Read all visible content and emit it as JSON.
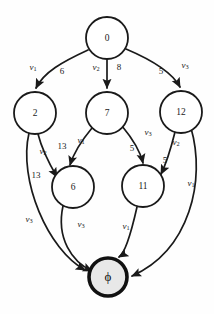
{
  "diagram": {
    "type": "directed-graph",
    "colors": {
      "node_fill": "#ffffff",
      "node_stroke": "#1a1a1a",
      "terminal_fill": "#e8e8e8",
      "terminal_stroke": "#111111",
      "edge_stroke": "#1a1a1a",
      "background": "#fefefe"
    },
    "nodes": [
      {
        "id": "n0",
        "label": "0",
        "cx": 107,
        "cy": 38,
        "r": 21,
        "kind": "normal"
      },
      {
        "id": "n2",
        "label": "2",
        "cx": 35,
        "cy": 113,
        "r": 21,
        "kind": "normal"
      },
      {
        "id": "n7",
        "label": "7",
        "cx": 107,
        "cy": 113,
        "r": 21,
        "kind": "normal"
      },
      {
        "id": "n12",
        "label": "12",
        "cx": 181,
        "cy": 112,
        "r": 21,
        "kind": "normal"
      },
      {
        "id": "n6",
        "label": "6",
        "cx": 73,
        "cy": 187,
        "r": 21,
        "kind": "normal"
      },
      {
        "id": "n11",
        "label": "11",
        "cx": 143,
        "cy": 186,
        "r": 21,
        "kind": "normal"
      },
      {
        "id": "nphi",
        "label": "ϕ",
        "cx": 108,
        "cy": 277,
        "r": 20,
        "kind": "terminal"
      }
    ],
    "edges": [
      {
        "id": "e0-2",
        "from": "n0",
        "to": "n2",
        "weight": "6",
        "variable": "v",
        "variable_sub": "1"
      },
      {
        "id": "e0-7",
        "from": "n0",
        "to": "n7",
        "weight": "8",
        "variable": "v",
        "variable_sub": "2"
      },
      {
        "id": "e0-12",
        "from": "n0",
        "to": "n12",
        "weight": "5",
        "variable": "v",
        "variable_sub": "3"
      },
      {
        "id": "e2-6",
        "from": "n2",
        "to": "n6",
        "weight": "13",
        "variable": "v",
        "variable_sub": "2"
      },
      {
        "id": "e2-phi",
        "from": "n2",
        "to": "nphi",
        "weight": "",
        "variable": "v",
        "variable_sub": "3"
      },
      {
        "id": "e7-6",
        "from": "n7",
        "to": "n6",
        "weight": "13",
        "variable": "v",
        "variable_sub": "1"
      },
      {
        "id": "e7-11",
        "from": "n7",
        "to": "n11",
        "weight": "5",
        "variable": "v",
        "variable_sub": "3"
      },
      {
        "id": "e12-11",
        "from": "n12",
        "to": "n11",
        "weight": "5",
        "variable": "v",
        "variable_sub": "2"
      },
      {
        "id": "e12-phi",
        "from": "n12",
        "to": "nphi",
        "weight": "",
        "variable": "v",
        "variable_sub": "1"
      },
      {
        "id": "e6-phi",
        "from": "n6",
        "to": "nphi",
        "weight": "",
        "variable": "v",
        "variable_sub": "3"
      },
      {
        "id": "e11-phi",
        "from": "n11",
        "to": "nphi",
        "weight": "",
        "variable": "v",
        "variable_sub": "1"
      }
    ],
    "edge_labels": [
      {
        "id": "lbl-v1-a",
        "kind": "variable",
        "text": "v",
        "sub": "1",
        "x": 33,
        "y": 68
      },
      {
        "id": "lbl-6",
        "kind": "weight",
        "text": "6",
        "sub": "",
        "x": 62,
        "y": 72
      },
      {
        "id": "lbl-v2-a",
        "kind": "variable",
        "text": "v",
        "sub": "2",
        "x": 96,
        "y": 68
      },
      {
        "id": "lbl-8",
        "kind": "weight",
        "text": "8",
        "sub": "",
        "x": 119,
        "y": 68
      },
      {
        "id": "lbl-5-a",
        "kind": "weight",
        "text": "5",
        "sub": "",
        "x": 161,
        "y": 72
      },
      {
        "id": "lbl-v3-a",
        "kind": "variable",
        "text": "v",
        "sub": "3",
        "x": 185,
        "y": 66
      },
      {
        "id": "lbl-v2-b",
        "kind": "variable",
        "text": "v",
        "sub": "2",
        "x": 43,
        "y": 152
      },
      {
        "id": "lbl-13-a",
        "kind": "weight",
        "text": "13",
        "sub": "",
        "x": 36,
        "y": 176
      },
      {
        "id": "lbl-13-b",
        "kind": "weight",
        "text": "13",
        "sub": "",
        "x": 62,
        "y": 147
      },
      {
        "id": "lbl-v1-b",
        "kind": "variable",
        "text": "v",
        "sub": "1",
        "x": 81,
        "y": 141
      },
      {
        "id": "lbl-5-b",
        "kind": "weight",
        "text": "5",
        "sub": "",
        "x": 132,
        "y": 149
      },
      {
        "id": "lbl-v3-b",
        "kind": "variable",
        "text": "v",
        "sub": "3",
        "x": 148,
        "y": 133
      },
      {
        "id": "lbl-v2-c",
        "kind": "variable",
        "text": "v",
        "sub": "2",
        "x": 176,
        "y": 143
      },
      {
        "id": "lbl-5-c",
        "kind": "weight",
        "text": "5",
        "sub": "",
        "x": 165,
        "y": 161
      },
      {
        "id": "lbl-v1-c",
        "kind": "variable",
        "text": "v",
        "sub": "1",
        "x": 191,
        "y": 184
      },
      {
        "id": "lbl-v3-c",
        "kind": "variable",
        "text": "v",
        "sub": "3",
        "x": 29,
        "y": 220
      },
      {
        "id": "lbl-v3-d",
        "kind": "variable",
        "text": "v",
        "sub": "3",
        "x": 81,
        "y": 225
      },
      {
        "id": "lbl-v1-d",
        "kind": "variable",
        "text": "v",
        "sub": "1",
        "x": 126,
        "y": 227
      }
    ]
  }
}
